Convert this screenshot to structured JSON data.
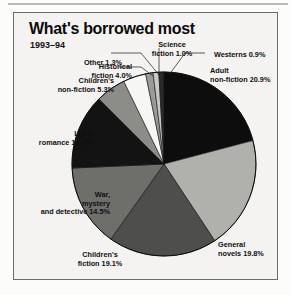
{
  "figure": {
    "title": "What's borrowed most",
    "subtitle": "1993–94"
  },
  "chart_data": {
    "type": "pie",
    "title": "What's borrowed most",
    "subtitle": "1993–94",
    "units": "percent",
    "legend": "none (direct callout labels)",
    "start_angle_deg": 0,
    "direction": "clockwise",
    "categories": [
      "Adult non-fiction",
      "General novels",
      "Children's fiction",
      "War, mystery and detective",
      "Light romance",
      "Children's non-fiction",
      "Historical fiction",
      "Other",
      "Science fiction",
      "Westerns"
    ],
    "values": [
      20.9,
      19.8,
      19.1,
      14.5,
      13.2,
      5.3,
      4.0,
      1.3,
      1.0,
      0.9
    ],
    "colors": [
      "#0d0d0d",
      "#b0b0ad",
      "#4e4e4c",
      "#6e6e6b",
      "#131313",
      "#8c8c89",
      "#f6f6f4",
      "#9a9a97",
      "#c9c9c6",
      "#2a2a28"
    ],
    "slices": [
      {
        "label": "Adult non-fiction",
        "value": 20.9,
        "display": "Adult\nnon-fiction 20.9%",
        "color": "#0d0d0d"
      },
      {
        "label": "General novels",
        "value": 19.8,
        "display": "General\nnovels 19.8%",
        "color": "#b0b0ad"
      },
      {
        "label": "Children's fiction",
        "value": 19.1,
        "display": "Children's\nfiction 19.1%",
        "color": "#4e4e4c"
      },
      {
        "label": "War, mystery and detective",
        "value": 14.5,
        "display": "War,\nmystery\nand detective 14.5%",
        "color": "#6e6e6b"
      },
      {
        "label": "Light romance",
        "value": 13.2,
        "display": "Light\nromance 13.2%",
        "color": "#131313"
      },
      {
        "label": "Children's non-fiction",
        "value": 5.3,
        "display": "Children's\nnon-fiction 5.3%",
        "color": "#8c8c89"
      },
      {
        "label": "Historical fiction",
        "value": 4.0,
        "display": "Historical\nfiction 4.0%",
        "color": "#f6f6f4"
      },
      {
        "label": "Other",
        "value": 1.3,
        "display": "Other 1.3%",
        "color": "#9a9a97"
      },
      {
        "label": "Science fiction",
        "value": 1.0,
        "display": "Science\nfiction 1.0%",
        "color": "#c9c9c6"
      },
      {
        "label": "Westerns",
        "value": 0.9,
        "display": "Westerns 0.9%",
        "color": "#2a2a28"
      }
    ]
  },
  "labels": {
    "other_l1": "Other 1.3%",
    "science_l1": "Science",
    "science_l2": "fiction 1.0%",
    "westerns_l1": "Westerns 0.9%",
    "historical_l1": "Historical",
    "historical_l2": "fiction 4.0%",
    "adult_l1": "Adult",
    "adult_l2": "non-fiction 20.9%",
    "childnonfic_l1": "Children's",
    "childnonfic_l2": "non-fiction 5.3%",
    "romance_l1": "Light",
    "romance_l2": "romance 13.2%",
    "war_l1": "War,",
    "war_l2": "mystery",
    "war_l3": "and detective 14.5%",
    "childfic_l1": "Children's",
    "childfic_l2": "fiction 19.1%",
    "general_l1": "General",
    "general_l2": "novels 19.8%"
  }
}
